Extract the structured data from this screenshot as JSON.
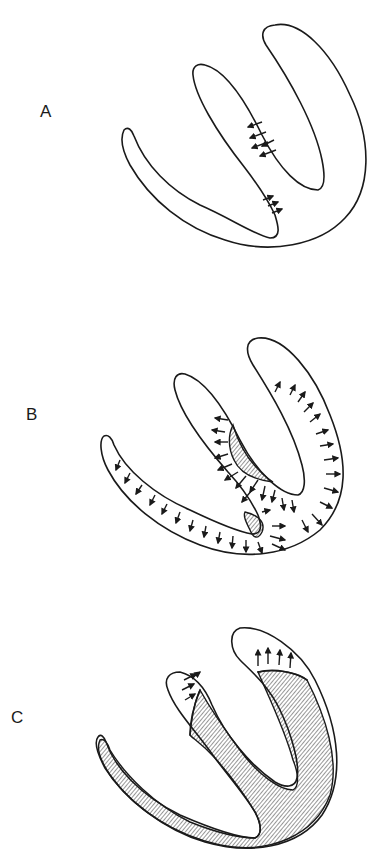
{
  "figure": {
    "panels": [
      {
        "id": "A",
        "label": "A",
        "description": "Heart outline with small arrows along septum"
      },
      {
        "id": "B",
        "label": "B",
        "description": "Heart outline with hatched regions and arrows radiating outward along walls"
      },
      {
        "id": "C",
        "label": "C",
        "description": "Heart outline largely hatched with arrows at top of chambers"
      }
    ],
    "colors": {
      "ink": "#1a1a1a",
      "background": "#ffffff"
    }
  }
}
